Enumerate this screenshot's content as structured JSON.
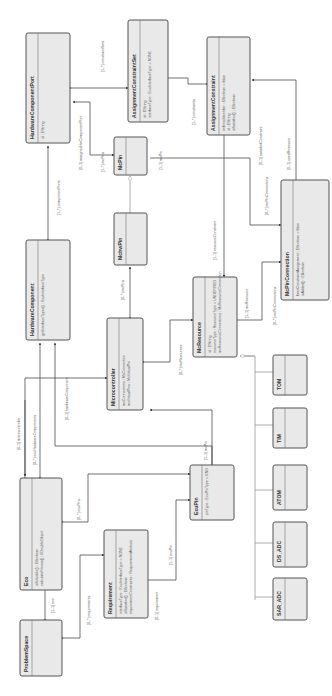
{
  "diagram": {
    "type": "uml-class-diagram",
    "orientation": "rotated-90-ccw",
    "classes": {
      "hardwareComponentPort": {
        "name": "HardwareComponentPort",
        "attrs": [
          "id : EString"
        ]
      },
      "assignmentConstraintSet": {
        "name": "AssignmentConstraintSet",
        "attrs": [
          "id : EString",
          "interfaceType : EcuInterfaceType = NONE"
        ]
      },
      "assignmentConstraint": {
        "name": "AssignmentConstraint",
        "attrs": [
          "enforceIdentifier : EBoolean = false",
          "id : EString",
          "isSatisfied() : EBoolean"
        ]
      },
      "mcPin": {
        "name": "McPin",
        "attrs": []
      },
      "mchwPin": {
        "name": "MchwPin",
        "attrs": []
      },
      "hardwareComponent": {
        "name": "HardwareComponent",
        "attrs": [
          "getInterfaceTypes() : EcuInterfaceType"
        ]
      },
      "microcontroller": {
        "name": "Microcontroller",
        "attrs": [
          "mcConnections : McConnection",
          "mcVirtualPins : McVirtualPin"
        ]
      },
      "mcResource": {
        "name": "McResource",
        "attrs": [
          "id : EString",
          "resourceType : ResourceType = UNDEFINED",
          "mcResourceConnections : McResourceConnection"
        ]
      },
      "mcPinConnection": {
        "name": "McPinConnection",
        "attrs": [
          "fixedConstraintAssignment : EBoolean = false",
          "isAdded() : EBoolean"
        ]
      },
      "tom": {
        "name": "TOM",
        "attrs": []
      },
      "tim": {
        "name": "TIM",
        "attrs": []
      },
      "atom": {
        "name": "ATOM",
        "attrs": []
      },
      "dsAdc": {
        "name": "DS_ADC",
        "attrs": []
      },
      "sarAdc": {
        "name": "SAR_ADC",
        "attrs": []
      },
      "eco": {
        "name": "Eco",
        "attrs": [
          "isSolvable() : EBoolean",
          "calculateFitness() : EDoubleObject"
        ]
      },
      "requirement": {
        "name": "Requirement",
        "attrs": [
          "interfaceType : EcuInterfaceType = NONE",
          "isSatisfied() : EBoolean",
          "requirementConstraints : RequirementAttribute"
        ]
      },
      "ecuPin": {
        "name": "EcuPin",
        "attrs": [
          "pinType : EcuPinType = GND"
        ]
      },
      "problemSpace": {
        "name": "ProblemSpace",
        "attrs": []
      }
    },
    "associations": {
      "constraintSets": "[1..*] constraintSets",
      "constraints": "[1..*] constraints",
      "componentPorts": "[1..*] componentPorts",
      "assignedHwComponentPort": "[0..1] assignedHwComponentPort",
      "mcPins1": "[1..*] mcPins",
      "mcPin": "[1..1] mcPin",
      "satisfiedConstraint": "[0..1] satisfiedConstraint",
      "usedResource": "[0..1] usedResource",
      "resourceConstraint": "[1..1] resourceConstraint",
      "mcPinConnections1": "[0..*] mcPinConnections",
      "mcResource": "[1..1] mcResource",
      "mcPinConnections2": "[0..*] mcPinConnections",
      "mcPins2": "[0..*] mcPins",
      "mcResources": "[0..*] mcResources",
      "microcontroller": "[0..1] microcontroller",
      "ecuHardwareComponents": "[0..*] ecuHardwareComponents",
      "hardwareComponent": "[0..1] hardwareComponent",
      "ecuPins": "[0..*] ecuPins",
      "ecuPin": "[1..1] ecuPin",
      "eco": "[1..1] eco",
      "requirements": "[0..*] requirements",
      "requirement": "[0..1] requirement",
      "mcPin3": "[1..1] mcPin"
    }
  }
}
